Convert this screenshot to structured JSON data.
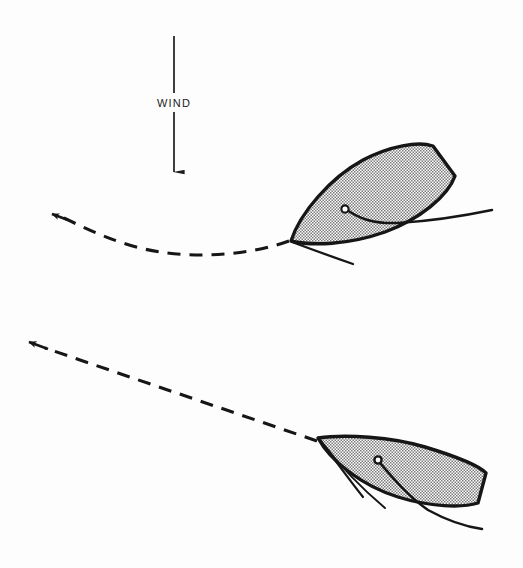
{
  "figure": {
    "background_color": "#fdfdfd",
    "width": 523,
    "height": 568
  },
  "wind": {
    "label": "WIND",
    "direction": "downward",
    "arrow_color": "#1c1c1c",
    "line_top_y": 36,
    "line_bottom_y": 185,
    "line_x": 174,
    "label_x": 174,
    "label_y": 103
  },
  "colors": {
    "hull_outline": "#161616",
    "hull_fill": "#b5b5b5",
    "line": "#161616",
    "dashed_path": "#161616",
    "text": "#1c1c1c"
  },
  "boats": [
    {
      "name": "upper-boat",
      "position": "upper-right",
      "heading_description": "bow to lower-left, transom to upper-right",
      "bow_point": "291,241",
      "transom_points": "432,146 455,176",
      "mast_circle": "345,209",
      "mast_radius": 3.5,
      "boom_end": "492,210",
      "tiller_end": "352,263"
    },
    {
      "name": "lower-boat",
      "position": "lower-right",
      "heading_description": "bow to left, transom to lower-right",
      "bow_point": "318,438",
      "transom_points": "486,473 478,503",
      "mast_circle": "378,460",
      "mast_radius": 3.5,
      "boom_end": "482,528",
      "tiller_end": "362,497"
    }
  ],
  "paths": [
    {
      "name": "upper-track",
      "style": "dashed",
      "shape": "curved",
      "description": "curved dashed course line with arrowhead pointing left",
      "start": "288,241",
      "end": "55,215",
      "arrow_at": "end"
    },
    {
      "name": "lower-track",
      "style": "dashed",
      "shape": "straight",
      "description": "straight dashed course line with arrowhead pointing up-left",
      "start": "316,441",
      "end": "30,343",
      "arrow_at": "end"
    }
  ]
}
